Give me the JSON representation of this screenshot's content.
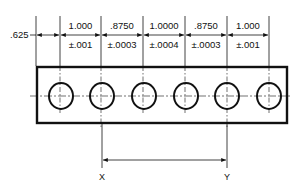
{
  "drawing": {
    "title": "",
    "left_offset": ".625",
    "spacings": [
      {
        "nominal": "1.000",
        "tolerance": "±.001"
      },
      {
        "nominal": ".8750",
        "tolerance": "±.0003"
      },
      {
        "nominal": "1.0000",
        "tolerance": "±.0004"
      },
      {
        "nominal": ".8750",
        "tolerance": "±.0003"
      },
      {
        "nominal": "1.000",
        "tolerance": "±.001"
      }
    ],
    "hole_count": 6,
    "datum_labels": {
      "left": "X",
      "right": "Y"
    },
    "colors": {
      "line": "#111111",
      "background": "#ffffff"
    }
  }
}
